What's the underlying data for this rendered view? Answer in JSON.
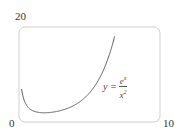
{
  "chart_data": {
    "type": "line",
    "title": "",
    "xlabel": "",
    "ylabel": "",
    "xlim": [
      0,
      10
    ],
    "ylim": [
      0,
      20
    ],
    "x_tick_labels": [
      "0",
      "10"
    ],
    "y_tick_labels": [
      "20"
    ],
    "grid": false,
    "series": [
      {
        "name": "y = e^x / x^2",
        "function": "e^x / x^2",
        "x": [
          0.25,
          0.5,
          0.75,
          1,
          1.5,
          2,
          2.5,
          3,
          3.5,
          4,
          4.5,
          5,
          5.5,
          6,
          6.5,
          6.6
        ],
        "values": [
          20.5,
          6.59,
          3.76,
          2.72,
          1.99,
          1.85,
          1.95,
          2.23,
          2.7,
          3.41,
          4.45,
          5.94,
          8.09,
          11.2,
          15.8,
          20.0
        ]
      }
    ],
    "annotations": [
      {
        "text": "y = e^x / x^2",
        "numerator": "e",
        "numerator_sup": "x",
        "denominator": "x",
        "denominator_sup": "2",
        "lhs": "y ="
      }
    ],
    "colors": {
      "curve": "#555555",
      "frame": "#cccccc"
    }
  },
  "labels": {
    "y_top": "20",
    "x_origin": "0",
    "x_right": "10",
    "eq_lhs": "y =",
    "eq_num": "e",
    "eq_num_sup": "x",
    "eq_den": "x",
    "eq_den_sup": "2"
  }
}
